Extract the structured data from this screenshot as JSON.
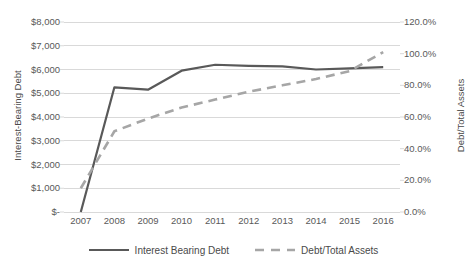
{
  "chart_data": {
    "type": "line",
    "title": "",
    "xlabel": "",
    "categories": [
      "2007",
      "2008",
      "2009",
      "2010",
      "2011",
      "2012",
      "2013",
      "2014",
      "2015",
      "2016"
    ],
    "grid": true,
    "legend_position": "bottom",
    "axes": {
      "left": {
        "label": "Interest-Bearing Debt",
        "ylim": [
          0,
          8000
        ],
        "tick_step": 1000,
        "tick_labels": [
          "$8,000",
          "$7,000",
          "$6,000",
          "$5,000",
          "$4,000",
          "$3,000",
          "$2,000",
          "$1,000",
          "$-"
        ],
        "tick_values": [
          8000,
          7000,
          6000,
          5000,
          4000,
          3000,
          2000,
          1000,
          0
        ]
      },
      "right": {
        "label": "Debt/Total Assets",
        "ylim": [
          0,
          120
        ],
        "tick_step": 20,
        "tick_labels": [
          "120.0%",
          "100.0%",
          "80.0%",
          "60.0%",
          "40.0%",
          "20.0%",
          "0.0%"
        ],
        "tick_values": [
          120,
          100,
          80,
          60,
          40,
          20,
          0
        ]
      }
    },
    "series": [
      {
        "name": "Interest Bearing Debt",
        "axis": "left",
        "style": "solid",
        "color": "#595959",
        "width": 2.2,
        "values": [
          0,
          5250,
          5150,
          5950,
          6200,
          6150,
          6130,
          6000,
          6050,
          6100
        ]
      },
      {
        "name": "Debt/Total Assets",
        "axis": "right",
        "style": "dashed",
        "color": "#a6a6a6",
        "width": 2.6,
        "values": [
          15,
          51,
          59,
          66,
          71,
          76,
          80,
          84,
          89,
          101
        ]
      }
    ]
  },
  "legend": {
    "items": [
      {
        "label": "Interest Bearing Debt",
        "icon": "solid-line-icon"
      },
      {
        "label": "Debt/Total Assets",
        "icon": "dashed-line-icon"
      }
    ]
  },
  "colors": {
    "gridline": "#d9d9d9",
    "text": "#595959",
    "series_solid": "#595959",
    "series_dashed": "#a6a6a6",
    "background": "#ffffff"
  }
}
